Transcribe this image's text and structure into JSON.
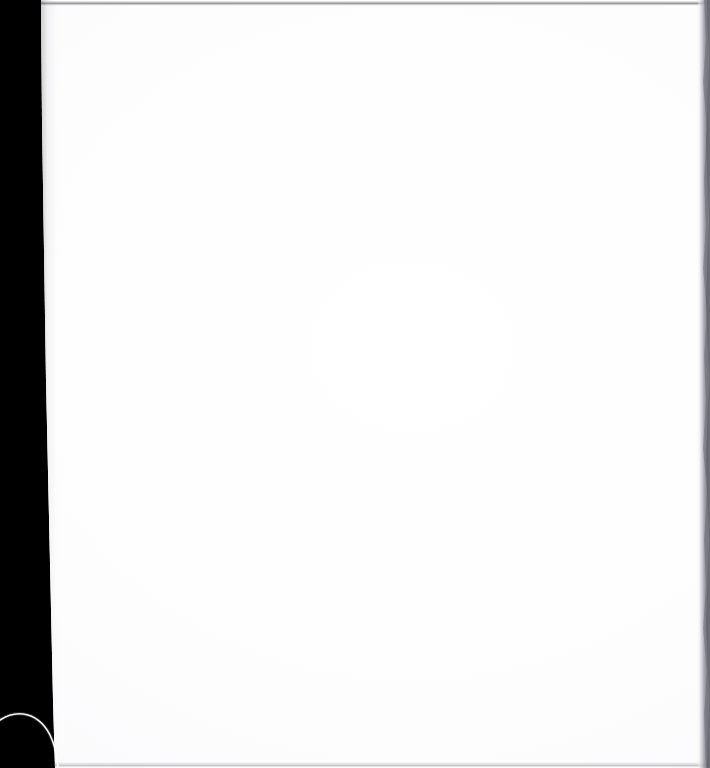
{
  "document": {
    "type": "scanned-page",
    "title": "Scanned blank page",
    "content_text": "",
    "page_state": "blank",
    "orientation": "portrait",
    "width_px": 710,
    "height_px": 768
  },
  "canvas": {
    "background_color": "#000000",
    "page_color": "#ffffff"
  },
  "regions": {
    "scanner_margin": {
      "name": "scanner-margin",
      "color": "#000000",
      "side": "left",
      "width_px": 55
    },
    "page_sheet": {
      "name": "page-sheet",
      "color": "#ffffff",
      "note": "blank white paper, no printed content"
    }
  },
  "scan_artifacts": {
    "top_edge": {
      "label": "top-scan-edge",
      "color": "#7a7a82",
      "position": "top"
    },
    "right_edge": {
      "label": "right-scan-edge",
      "color": "#7e7e87",
      "position": "right"
    },
    "bottom_edge": {
      "label": "bottom-scan-edge",
      "color": "#a8a8b0",
      "position": "bottom"
    },
    "corner_arc": {
      "label": "page-corner-arc",
      "color": "#ffffff",
      "position": "bottom-left"
    }
  }
}
